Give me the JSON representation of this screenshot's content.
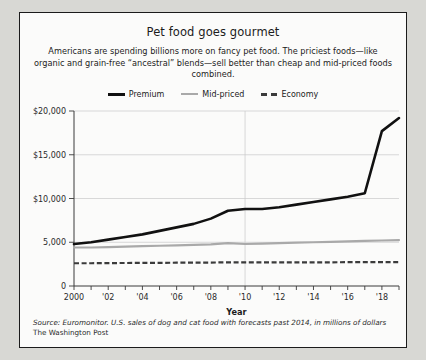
{
  "figure": {
    "title": "Pet food goes gourmet",
    "subtitle": "Americans are spending billions more on fancy pet food. The priciest foods—like organic and grain-free “ancestral” blends—sell better than cheap and mid-priced foods combined.",
    "source": "Source: Euromonitor. U.S. sales of dog and cat food with forecasts past 2014, in millions of dollars",
    "publisher": "The Washington Post"
  },
  "colors": {
    "premium": "#111111",
    "mid_priced": "#a9a9a9",
    "economy": "#3b3b3b",
    "grid": "#c9c9c9",
    "axis": "#3a3a3a",
    "panel_background": "#fbfbfa",
    "page_background": "#d8d8d4",
    "border": "#1b1b1b"
  },
  "legend": {
    "position": "top-center",
    "entries": [
      {
        "label": "Premium",
        "key": "premium",
        "style": "solid"
      },
      {
        "label": "Mid-priced",
        "key": "mid_priced",
        "style": "solid"
      },
      {
        "label": "Economy",
        "key": "economy",
        "style": "dashed"
      }
    ]
  },
  "chart_data": {
    "type": "line",
    "title": "Pet food goes gourmet",
    "xlabel": "Year",
    "ylabel": "",
    "xlim": [
      2000,
      2019
    ],
    "ylim": [
      0,
      20000
    ],
    "grid": true,
    "x": [
      2000,
      2001,
      2002,
      2003,
      2004,
      2005,
      2006,
      2007,
      2008,
      2009,
      2010,
      2011,
      2012,
      2013,
      2014,
      2015,
      2016,
      2017,
      2018,
      2019
    ],
    "xtick_labels": [
      "2000",
      "",
      "'02",
      "",
      "'04",
      "",
      "'06",
      "",
      "'08",
      "",
      "'10",
      "",
      "'12",
      "",
      "'14",
      "",
      "'16",
      "",
      "'18",
      ""
    ],
    "ytick_values": [
      0,
      5000,
      10000,
      15000,
      20000
    ],
    "ytick_labels": [
      "0",
      "5,000",
      "$10,000",
      "$15,000",
      "$20,000"
    ],
    "series": [
      {
        "name": "Premium",
        "color": "#111111",
        "style": "solid",
        "values": [
          4800,
          5000,
          5300,
          5600,
          5900,
          6300,
          6700,
          7100,
          7700,
          8600,
          8800,
          8800,
          9000,
          9300,
          9600,
          9900,
          10200,
          10600,
          17700,
          19200
        ]
      },
      {
        "name": "Mid-priced",
        "color": "#a9a9a9",
        "style": "solid",
        "values": [
          4400,
          4400,
          4450,
          4500,
          4550,
          4600,
          4650,
          4700,
          4750,
          4900,
          4800,
          4850,
          4900,
          4950,
          5000,
          5050,
          5100,
          5150,
          5200,
          5250
        ]
      },
      {
        "name": "Economy",
        "color": "#3b3b3b",
        "style": "dashed",
        "values": [
          2600,
          2600,
          2620,
          2630,
          2640,
          2650,
          2660,
          2670,
          2680,
          2700,
          2700,
          2700,
          2700,
          2700,
          2710,
          2710,
          2720,
          2720,
          2730,
          2730
        ]
      }
    ]
  }
}
